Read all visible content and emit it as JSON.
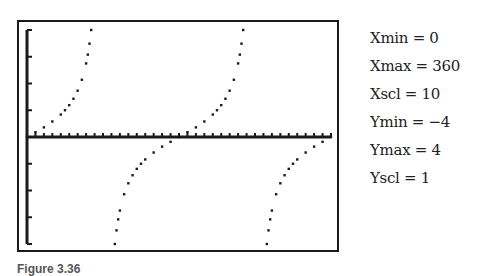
{
  "chart_data": {
    "type": "scatter",
    "title": "",
    "function": "y = tan(x)",
    "xlabel": "",
    "ylabel": "",
    "xlim": [
      0,
      360
    ],
    "ylim": [
      -4,
      4
    ],
    "x_tick_step": 10,
    "y_tick_step": 1,
    "grid": false,
    "legend": "none",
    "series": [
      {
        "name": "tan(x) branch 1",
        "x": [
          0,
          10,
          20,
          30,
          40,
          45,
          50,
          55,
          60,
          65,
          70,
          72,
          74,
          76
        ],
        "y": [
          0,
          0.18,
          0.36,
          0.58,
          0.84,
          1.0,
          1.19,
          1.43,
          1.73,
          2.14,
          2.75,
          3.08,
          3.49,
          4.0
        ]
      },
      {
        "name": "tan(x) branch 2",
        "x": [
          104,
          106,
          108,
          110,
          115,
          120,
          125,
          130,
          135,
          140,
          150,
          160,
          170,
          180,
          190,
          200,
          210,
          220,
          225,
          230,
          235,
          240,
          245,
          250,
          252,
          254,
          256
        ],
        "y": [
          -4.0,
          -3.49,
          -3.08,
          -2.75,
          -2.14,
          -1.73,
          -1.43,
          -1.19,
          -1.0,
          -0.84,
          -0.58,
          -0.36,
          -0.18,
          0,
          0.18,
          0.36,
          0.58,
          0.84,
          1.0,
          1.19,
          1.43,
          1.73,
          2.14,
          2.75,
          3.08,
          3.49,
          4.0
        ]
      },
      {
        "name": "tan(x) branch 3",
        "x": [
          284,
          286,
          288,
          290,
          295,
          300,
          305,
          310,
          315,
          320,
          330,
          340,
          350,
          360
        ],
        "y": [
          -4.0,
          -3.49,
          -3.08,
          -2.75,
          -2.14,
          -1.73,
          -1.43,
          -1.19,
          -1.0,
          -0.84,
          -0.58,
          -0.36,
          -0.18,
          0
        ]
      }
    ]
  },
  "window_settings": [
    {
      "label": "Xmin = 0"
    },
    {
      "label": "Xmax = 360"
    },
    {
      "label": "Xscl = 10"
    },
    {
      "label": "Ymin = −4"
    },
    {
      "label": "Ymax = 4"
    },
    {
      "label": "Yscl = 1"
    }
  ],
  "caption": "Figure 3.36",
  "colors": {
    "ink": "#1a1a1a",
    "background": "#ffffff"
  }
}
